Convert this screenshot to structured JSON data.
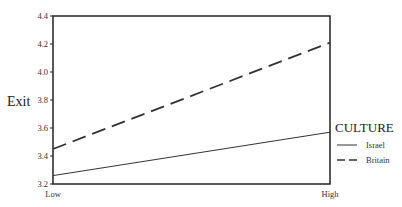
{
  "chart_data": {
    "type": "line",
    "title": "",
    "xlabel": "",
    "ylabel": "Exit",
    "categories": [
      "Low",
      "High"
    ],
    "series": [
      {
        "name": "Israel",
        "style": "solid",
        "values": [
          3.26,
          3.57
        ]
      },
      {
        "name": "Britain",
        "style": "dashed",
        "values": [
          3.45,
          4.21
        ]
      }
    ],
    "ylim": [
      3.2,
      4.4
    ],
    "yticks": [
      "3.2",
      "3.4",
      "3.6",
      "3.8",
      "4.0",
      "4.2",
      "4.4"
    ],
    "grid": false,
    "legend": {
      "title": "CULTURE",
      "position": "right",
      "entries": [
        "Israel",
        "Britain"
      ]
    }
  },
  "colors": {
    "line": "#333333",
    "axis": "#222222",
    "background": "#ffffff"
  }
}
